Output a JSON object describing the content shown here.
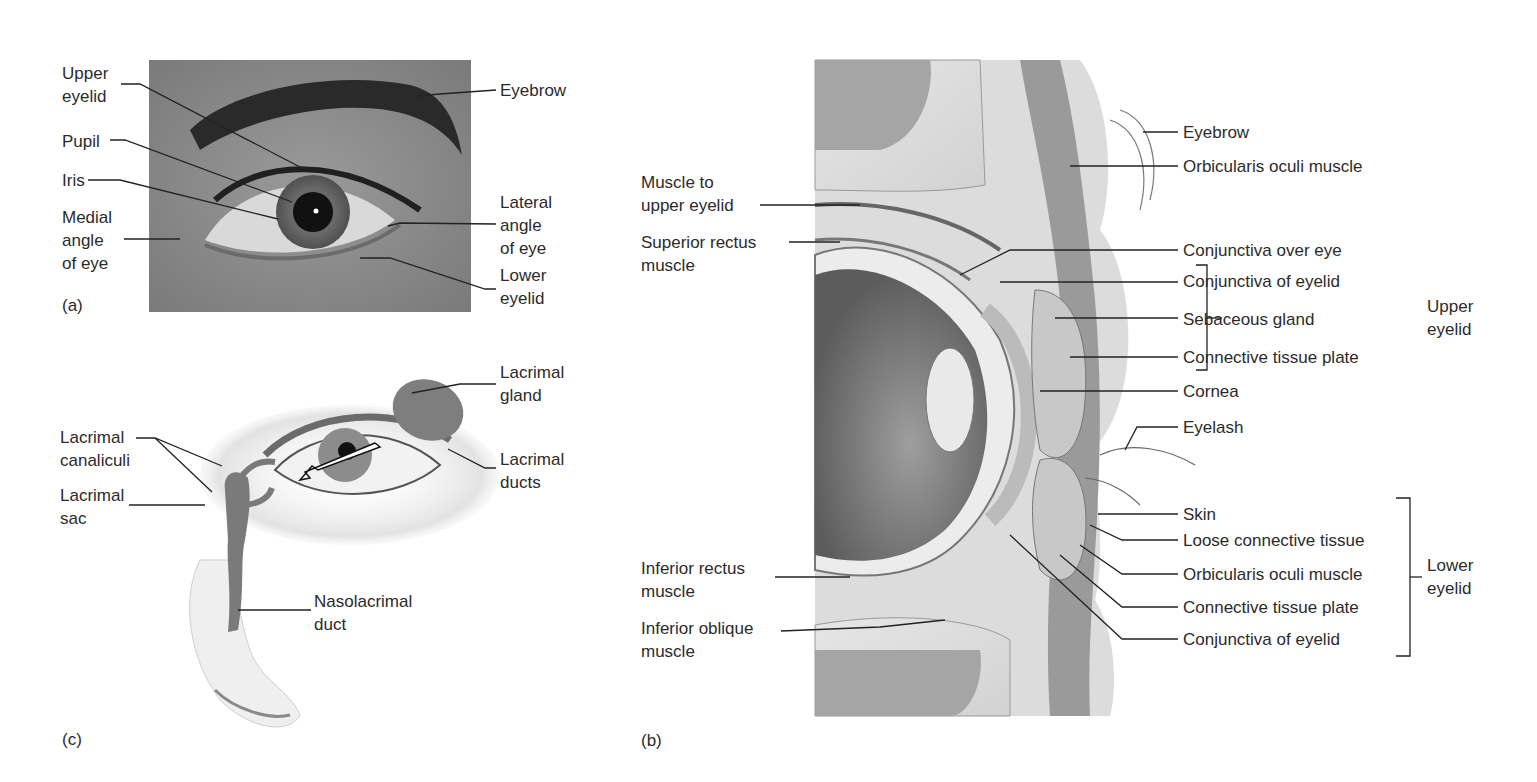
{
  "figure": {
    "panels": [
      {
        "id": "a",
        "letter": "(a)",
        "kind": "photograph of surface anatomy of the eye",
        "labels": {
          "upper_eyelid": "Upper\neyelid",
          "pupil": "Pupil",
          "iris": "Iris",
          "medial_angle": "Medial\nangle\nof eye",
          "eyebrow": "Eyebrow",
          "lateral_angle": "Lateral\nangle\nof eye",
          "lower_eyelid": "Lower\neyelid"
        }
      },
      {
        "id": "c",
        "letter": "(c)",
        "kind": "illustration of lacrimal apparatus",
        "labels": {
          "lacrimal_gland": "Lacrimal\ngland",
          "lacrimal_canaliculi": "Lacrimal\ncanaliculi",
          "lacrimal_ducts": "Lacrimal\nducts",
          "lacrimal_sac": "Lacrimal\nsac",
          "nasolacrimal_duct": "Nasolacrimal\nduct"
        }
      },
      {
        "id": "b",
        "letter": "(b)",
        "kind": "sagittal section of eyelids and anterior eye",
        "left_labels": {
          "muscle_upper_eyelid": "Muscle to\nupper eyelid",
          "superior_rectus": "Superior rectus\nmuscle",
          "inferior_rectus": "Inferior rectus\nmuscle",
          "inferior_oblique": "Inferior oblique\nmuscle"
        },
        "right_labels": {
          "eyebrow": "Eyebrow",
          "orbicularis_upper": "Orbicularis oculi muscle",
          "conjunctiva_over_eye": "Conjunctiva over eye",
          "conjunctiva_eyelid_upper": "Conjunctiva of eyelid",
          "sebaceous_gland": "Sebaceous gland",
          "connective_plate_upper": "Connective tissue plate",
          "cornea": "Cornea",
          "eyelash": "Eyelash",
          "skin": "Skin",
          "loose_connective": "Loose connective tissue",
          "orbicularis_lower": "Orbicularis oculi muscle",
          "connective_plate_lower": "Connective tissue plate",
          "conjunctiva_eyelid_lower": "Conjunctiva of eyelid"
        },
        "brackets": {
          "upper_eyelid": "Upper\neyelid",
          "lower_eyelid": "Lower\neyelid"
        }
      }
    ]
  }
}
